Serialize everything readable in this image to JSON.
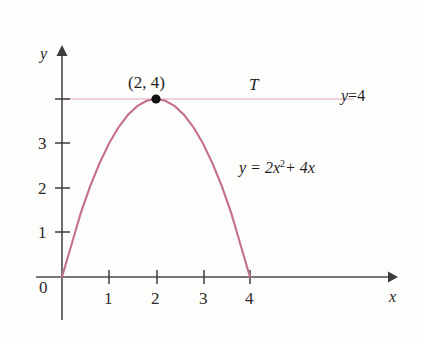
{
  "figure": {
    "background_color": "#fdfdfc",
    "axis_color": "#4a4a4a",
    "curve_color": "#c4708a",
    "guide_color": "#e8c3cf",
    "point_color": "#111111",
    "text_color": "#1d1d1d"
  },
  "chart_data": {
    "type": "line",
    "title": "",
    "subtitle": "",
    "xlabel": "x",
    "ylabel": "y",
    "xlim": [
      -0.35,
      7.0
    ],
    "ylim": [
      -0.95,
      5.2
    ],
    "grid": false,
    "legend": "none",
    "xticks": [
      0,
      1,
      2,
      3,
      4
    ],
    "xtick_labels": [
      "0",
      "1",
      "2",
      "3",
      "4"
    ],
    "yticks": [
      1,
      2,
      3,
      4
    ],
    "ytick_labels": [
      "1",
      "2",
      "3",
      ""
    ],
    "series": [
      {
        "name": "y = 2x^2 + 4x",
        "type": "line",
        "color": "#c4708a",
        "label_text": "y = 2x",
        "label_exponent": "2",
        "label_tail": "+ 4x",
        "x": [
          0.0,
          0.2,
          0.4,
          0.6,
          0.8,
          1.0,
          1.2,
          1.4,
          1.6,
          1.8,
          2.0,
          2.2,
          2.4,
          2.6,
          2.8,
          3.0,
          3.2,
          3.4,
          3.6,
          3.8,
          4.0
        ],
        "y": [
          0.0,
          0.72,
          1.44,
          2.04,
          2.56,
          3.0,
          3.36,
          3.64,
          3.84,
          3.96,
          4.0,
          3.96,
          3.84,
          3.64,
          3.36,
          3.0,
          2.56,
          2.04,
          1.44,
          0.72,
          0.0
        ]
      },
      {
        "name": "y = 4",
        "type": "line",
        "color": "#e8c3cf",
        "label_text": "y = 4",
        "label_lhs": "y",
        "label_op": "=",
        "label_rhs": "4",
        "x": [
          0.0,
          6.2
        ],
        "y": [
          4.0,
          4.0
        ]
      }
    ],
    "points": [
      {
        "name": "vertex",
        "x": 2,
        "y": 4,
        "label": "(2, 4)",
        "marker": "filled-circle",
        "color": "#111111"
      }
    ],
    "annotations": [
      {
        "name": "tangent-line-label",
        "text": "T",
        "x": 4.05,
        "y": 4.55
      }
    ]
  },
  "labels": {
    "y_axis": "y",
    "x_axis": "x",
    "vertex": "(2, 4)",
    "t": "T",
    "line_equation": "y = 4",
    "curve_equation": "y = 2x² + 4x"
  }
}
